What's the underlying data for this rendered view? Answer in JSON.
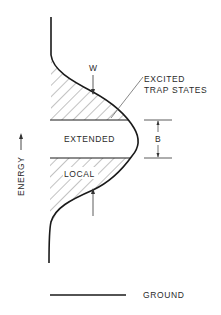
{
  "diagram": {
    "labels": {
      "w": "W",
      "excited_line1": "EXCITED",
      "excited_line2": "TRAP STATES",
      "extended": "EXTENDED",
      "local": "LOCAL",
      "b": "B",
      "energy": "ENERGY",
      "ground": "GROUND"
    },
    "colors": {
      "line": "#1a1a1a",
      "hatch": "#6a6a6a",
      "background": "#ffffff"
    }
  }
}
